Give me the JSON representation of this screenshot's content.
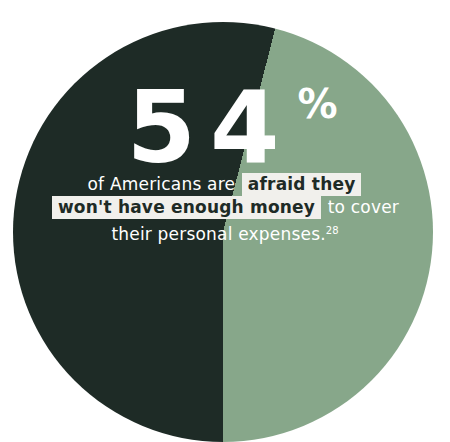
{
  "colors": {
    "page_bg": "#FFFFFF",
    "dark_slice": "#1E2B26",
    "light_slice": "#87A78A",
    "highlight_bg": "#F1F0EC",
    "highlight_text": "#1E2B26",
    "text": "#FFFFFF"
  },
  "chart_data": {
    "type": "pie",
    "title": "54% of Americans are afraid they won't have enough money to cover their personal expenses.",
    "slices": [
      {
        "label": "afraid they won't have enough money",
        "value": 54,
        "color": "#1E2B26"
      },
      {
        "label": "",
        "value": 46,
        "color": "#87A78A"
      }
    ],
    "data_labels": [
      "54%"
    ],
    "legend": "none",
    "annotations": [
      "of Americans are afraid they won't have enough money to cover their personal expenses.",
      "footnote reference: 28"
    ]
  },
  "stat": {
    "value": "54",
    "percent_sign": "%"
  },
  "caption": {
    "line1": {
      "regular": "of Americans are",
      "highlight": "afraid they"
    },
    "line2": {
      "highlight": "won't have enough money",
      "regular": "to cover"
    },
    "line3": {
      "text": "their personal expenses.",
      "footnote_ref": "28"
    }
  }
}
